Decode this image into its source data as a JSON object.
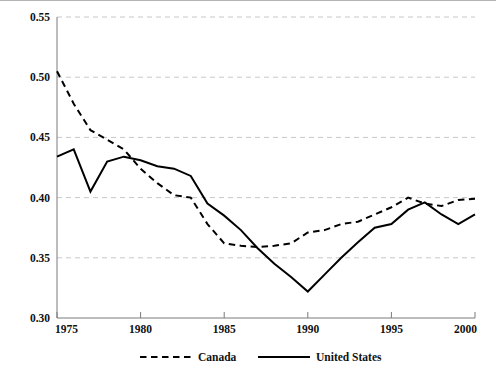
{
  "chart_data": {
    "type": "line",
    "title": "",
    "subtitle": "",
    "xlabel": "",
    "ylabel": "",
    "xlim": [
      1975,
      2000
    ],
    "ylim": [
      0.3,
      0.55
    ],
    "x": [
      1975,
      1976,
      1977,
      1978,
      1979,
      1980,
      1981,
      1982,
      1983,
      1984,
      1985,
      1986,
      1987,
      1988,
      1989,
      1990,
      1991,
      1992,
      1993,
      1994,
      1995,
      1996,
      1997,
      1998,
      1999,
      2000
    ],
    "xticks": [
      1975,
      1980,
      1985,
      1990,
      1995,
      2000
    ],
    "xtick_labels": [
      "1975",
      "1980",
      "1985",
      "1990",
      "1995",
      "2000"
    ],
    "yticks": [
      0.3,
      0.35,
      0.4,
      0.45,
      0.5,
      0.55
    ],
    "ytick_labels": [
      "0.30",
      "0.35",
      "0.40",
      "0.45",
      "0.50",
      "0.55"
    ],
    "grid": "horizontal-dashed",
    "legend_position": "bottom-center",
    "series": [
      {
        "name": "Canada",
        "style": "dashed",
        "color": "#000000",
        "values": [
          0.505,
          0.478,
          0.456,
          0.448,
          0.44,
          0.424,
          0.412,
          0.402,
          0.4,
          0.378,
          0.362,
          0.36,
          0.359,
          0.36,
          0.362,
          0.371,
          0.373,
          0.378,
          0.38,
          0.386,
          0.392,
          0.4,
          0.395,
          0.393,
          0.398,
          0.399
        ]
      },
      {
        "name": "United States",
        "style": "solid",
        "color": "#000000",
        "values": [
          0.434,
          0.44,
          0.405,
          0.43,
          0.434,
          0.431,
          0.426,
          0.424,
          0.418,
          0.395,
          0.385,
          0.373,
          0.358,
          0.345,
          0.334,
          0.322,
          0.336,
          0.35,
          0.363,
          0.375,
          0.378,
          0.39,
          0.396,
          0.386,
          0.378,
          0.386
        ]
      }
    ]
  },
  "legend": {
    "entries": [
      {
        "label": "Canada",
        "style": "dashed"
      },
      {
        "label": "United States",
        "style": "solid"
      }
    ]
  },
  "colors": {
    "series": "#000000",
    "grid": "#c8c8c8",
    "axis": "#7a7a7a",
    "text": "#111111",
    "background": "#ffffff"
  }
}
